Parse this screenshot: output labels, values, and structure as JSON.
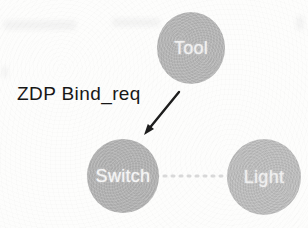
{
  "figure": {
    "background_color": "#fdfdfc",
    "nodes": [
      {
        "id": "tool",
        "label": "Tool",
        "fill": "#b6b6b6",
        "label_color": "#f1f1f1"
      },
      {
        "id": "switch",
        "label": "Switch",
        "fill": "#b3b3b3",
        "label_color": "#f6f6f6"
      },
      {
        "id": "light",
        "label": "Light",
        "fill": "#bdbdbd",
        "label_color": "#f0f0f0"
      }
    ],
    "edges": [
      {
        "from": "tool",
        "to": "switch",
        "type": "solid-arrow",
        "label": "ZDP Bind_req",
        "color": "#1c1c1c",
        "label_color": "#161616"
      },
      {
        "from": "switch",
        "to": "light",
        "type": "dotted",
        "label": "",
        "color": "#d9d9d9"
      }
    ]
  }
}
